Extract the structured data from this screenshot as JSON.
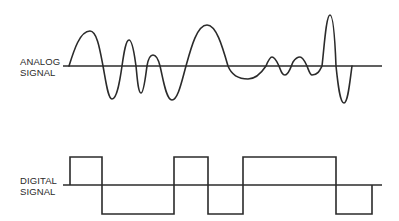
{
  "diagram": {
    "analog": {
      "label_line1": "ANALOG",
      "label_line2": "SIGNAL"
    },
    "digital": {
      "label_line1": "DIGITAL",
      "label_line2": "SIGNAL"
    },
    "colors": {
      "stroke": "#2b2b2b",
      "text": "#2a2a2a",
      "background": "#ffffff"
    }
  }
}
